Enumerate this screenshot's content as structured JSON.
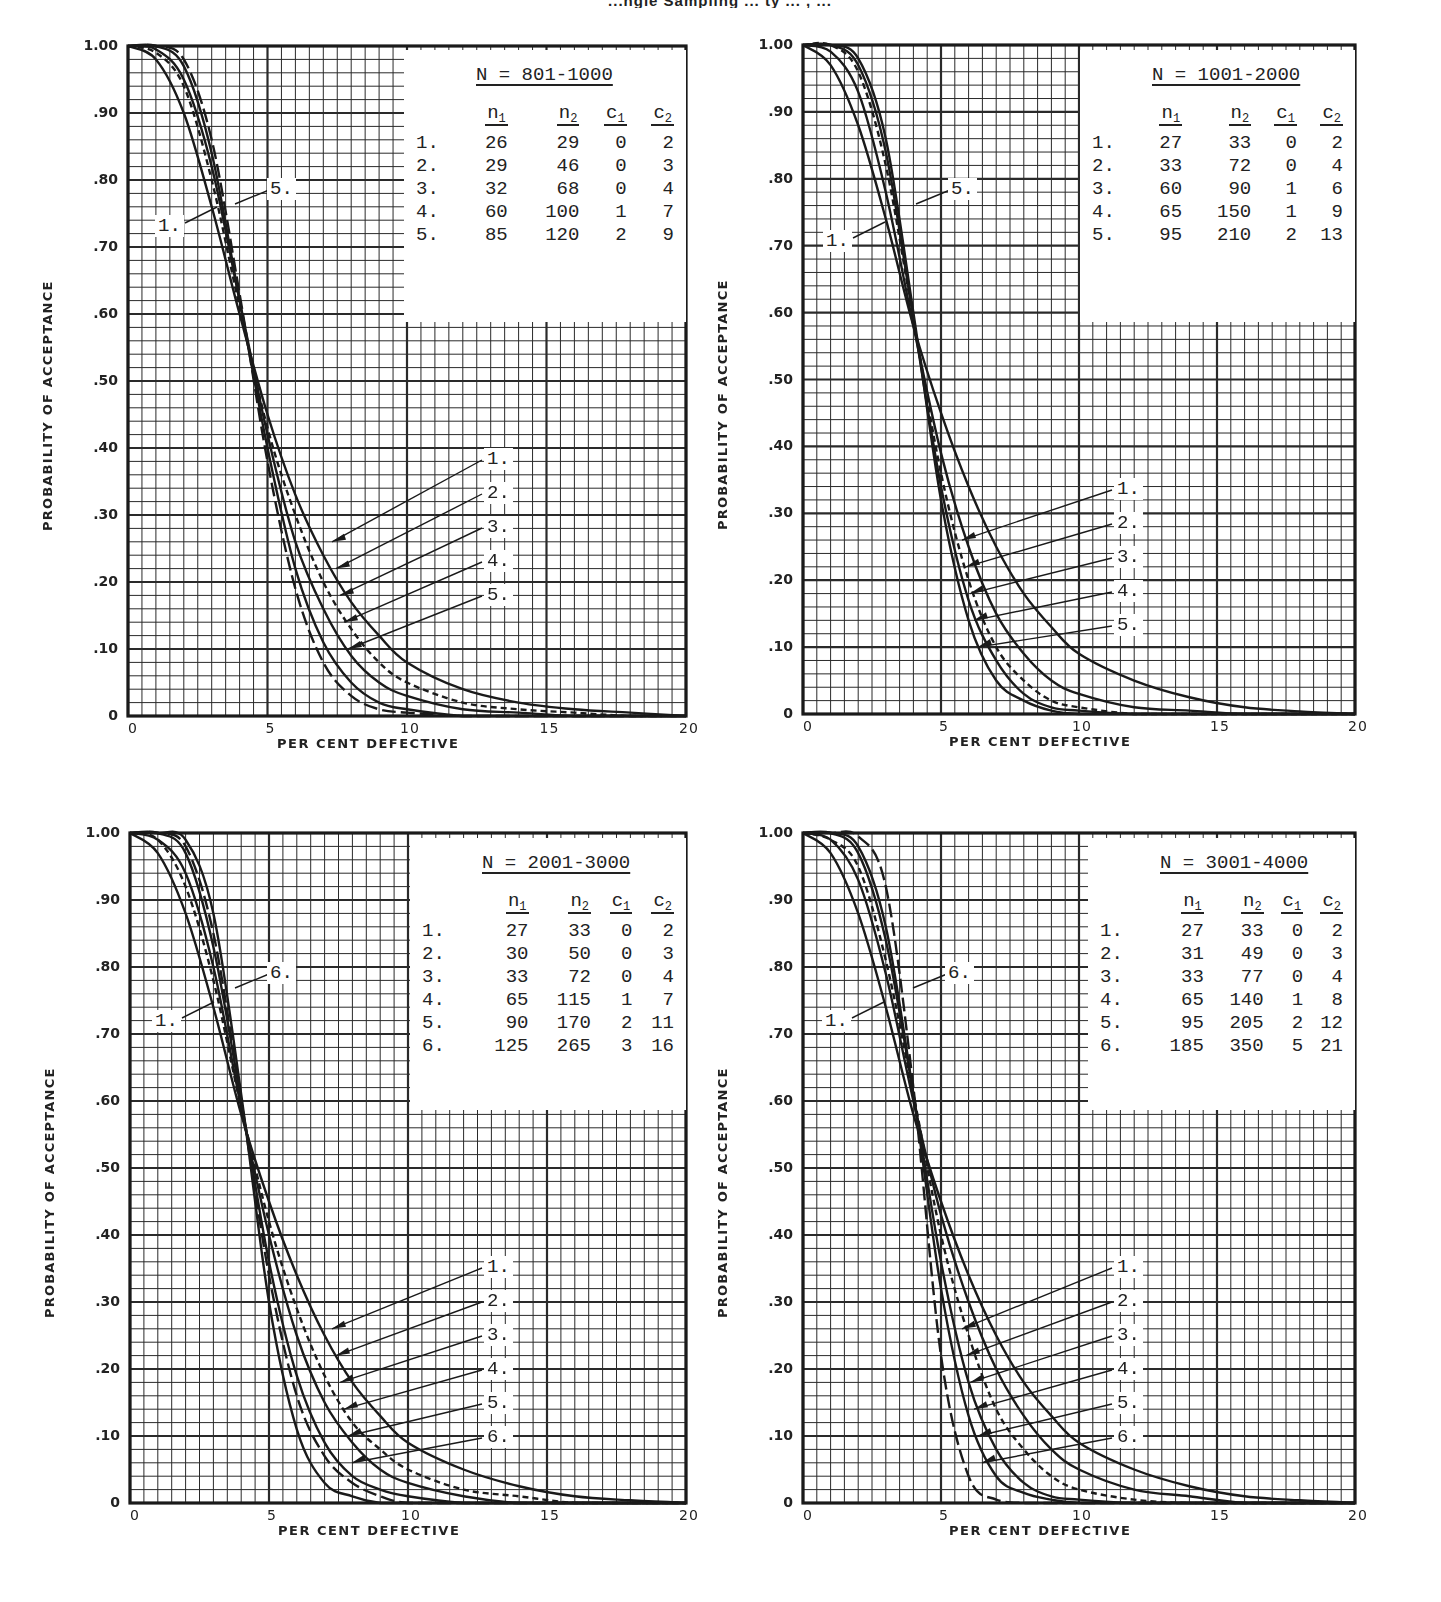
{
  "page": {
    "title_fragment": "...ngle Sampling ... ty ... , ..."
  },
  "axes": {
    "ylabel": "PROBABILITY OF ACCEPTANCE",
    "xlabel": "PER CENT DEFECTIVE",
    "yticks": [
      "1.00",
      ".90",
      ".80",
      ".70",
      ".60",
      ".50",
      ".40",
      ".30",
      ".20",
      ".10",
      "0"
    ],
    "xticks": [
      "0",
      "5",
      "10",
      "15",
      "20"
    ]
  },
  "legend_headers": {
    "n1": "n",
    "n1_sub": "1",
    "n2": "n",
    "n2_sub": "2",
    "c1": "c",
    "c1_sub": "1",
    "c2": "c",
    "c2_sub": "2"
  },
  "chart_data": [
    {
      "type": "line",
      "title": "N = 801-1000",
      "xlabel": "PER CENT DEFECTIVE",
      "ylabel": "PROBABILITY OF ACCEPTANCE",
      "xlim": [
        0,
        20
      ],
      "ylim": [
        0,
        1.0
      ],
      "grid": true,
      "legend_position": "upper right",
      "plans": [
        {
          "idx": "1.",
          "n1": 26,
          "n2": 29,
          "c1": 0,
          "c2": 2
        },
        {
          "idx": "2.",
          "n1": 29,
          "n2": 46,
          "c1": 0,
          "c2": 3
        },
        {
          "idx": "3.",
          "n1": 32,
          "n2": 68,
          "c1": 0,
          "c2": 4
        },
        {
          "idx": "4.",
          "n1": 60,
          "n2": 100,
          "c1": 1,
          "c2": 7
        },
        {
          "idx": "5.",
          "n1": 85,
          "n2": 120,
          "c1": 2,
          "c2": 9
        }
      ],
      "annotations": [
        "1.",
        "5.",
        "1.",
        "2.",
        "3.",
        "4.",
        "5."
      ],
      "x": [
        0,
        1,
        2,
        3,
        4,
        5,
        6,
        7,
        8,
        9,
        10,
        12,
        14,
        16,
        18,
        20
      ],
      "series": [
        {
          "name": "1.",
          "style": "solid",
          "values": [
            1.0,
            0.98,
            0.9,
            0.76,
            0.6,
            0.45,
            0.33,
            0.24,
            0.17,
            0.12,
            0.08,
            0.04,
            0.02,
            0.01,
            0.005,
            0.0
          ]
        },
        {
          "name": "2.",
          "style": "dashed",
          "values": [
            1.0,
            0.99,
            0.94,
            0.8,
            0.61,
            0.43,
            0.3,
            0.2,
            0.13,
            0.08,
            0.05,
            0.02,
            0.01,
            0.005,
            0.0,
            0.0
          ]
        },
        {
          "name": "3.",
          "style": "solid",
          "values": [
            1.0,
            0.995,
            0.95,
            0.82,
            0.62,
            0.42,
            0.26,
            0.16,
            0.09,
            0.05,
            0.03,
            0.01,
            0.005,
            0.0,
            0.0,
            0.0
          ]
        },
        {
          "name": "4.",
          "style": "solid",
          "values": [
            1.0,
            1.0,
            0.97,
            0.84,
            0.62,
            0.4,
            0.22,
            0.11,
            0.05,
            0.02,
            0.01,
            0.0,
            0.0,
            0.0,
            0.0,
            0.0
          ]
        },
        {
          "name": "5.",
          "style": "long-dash",
          "values": [
            1.0,
            1.0,
            0.98,
            0.86,
            0.63,
            0.38,
            0.19,
            0.08,
            0.03,
            0.01,
            0.005,
            0.0,
            0.0,
            0.0,
            0.0,
            0.0
          ]
        }
      ]
    },
    {
      "type": "line",
      "title": "N = 1001-2000",
      "xlabel": "PER CENT DEFECTIVE",
      "ylabel": "PROBABILITY OF ACCEPTANCE",
      "xlim": [
        0,
        20
      ],
      "ylim": [
        0,
        1.0
      ],
      "grid": true,
      "legend_position": "upper right",
      "plans": [
        {
          "idx": "1.",
          "n1": 27,
          "n2": 33,
          "c1": 0,
          "c2": 2
        },
        {
          "idx": "2.",
          "n1": 33,
          "n2": 72,
          "c1": 0,
          "c2": 4
        },
        {
          "idx": "3.",
          "n1": 60,
          "n2": 90,
          "c1": 1,
          "c2": 6
        },
        {
          "idx": "4.",
          "n1": 65,
          "n2": 150,
          "c1": 1,
          "c2": 9
        },
        {
          "idx": "5.",
          "n1": 95,
          "n2": 210,
          "c1": 2,
          "c2": 13
        }
      ],
      "annotations": [
        "1.",
        "5.",
        "1.",
        "2.",
        "3.",
        "4.",
        "5."
      ],
      "x": [
        0,
        1,
        2,
        3,
        4,
        5,
        6,
        7,
        8,
        9,
        10,
        12,
        14,
        16,
        18,
        20
      ],
      "series": [
        {
          "name": "1.",
          "style": "solid",
          "values": [
            1.0,
            0.97,
            0.88,
            0.74,
            0.58,
            0.45,
            0.34,
            0.25,
            0.18,
            0.13,
            0.09,
            0.05,
            0.025,
            0.01,
            0.004,
            0.0
          ]
        },
        {
          "name": "2.",
          "style": "solid",
          "values": [
            1.0,
            0.99,
            0.93,
            0.78,
            0.58,
            0.39,
            0.25,
            0.15,
            0.09,
            0.05,
            0.03,
            0.01,
            0.005,
            0.0,
            0.0,
            0.0
          ]
        },
        {
          "name": "3.",
          "style": "dashed",
          "values": [
            1.0,
            1.0,
            0.96,
            0.82,
            0.59,
            0.36,
            0.2,
            0.1,
            0.05,
            0.02,
            0.01,
            0.0,
            0.0,
            0.0,
            0.0,
            0.0
          ]
        },
        {
          "name": "4.",
          "style": "solid",
          "values": [
            1.0,
            1.0,
            0.97,
            0.84,
            0.59,
            0.34,
            0.17,
            0.08,
            0.03,
            0.01,
            0.005,
            0.0,
            0.0,
            0.0,
            0.0,
            0.0
          ]
        },
        {
          "name": "5.",
          "style": "solid",
          "values": [
            1.0,
            1.0,
            0.98,
            0.86,
            0.6,
            0.32,
            0.14,
            0.05,
            0.02,
            0.005,
            0.0,
            0.0,
            0.0,
            0.0,
            0.0,
            0.0
          ]
        }
      ]
    },
    {
      "type": "line",
      "title": "N = 2001-3000",
      "xlabel": "PER CENT DEFECTIVE",
      "ylabel": "PROBABILITY OF ACCEPTANCE",
      "xlim": [
        0,
        20
      ],
      "ylim": [
        0,
        1.0
      ],
      "grid": true,
      "legend_position": "upper right",
      "plans": [
        {
          "idx": "1.",
          "n1": 27,
          "n2": 33,
          "c1": 0,
          "c2": 2
        },
        {
          "idx": "2.",
          "n1": 30,
          "n2": 50,
          "c1": 0,
          "c2": 3
        },
        {
          "idx": "3.",
          "n1": 33,
          "n2": 72,
          "c1": 0,
          "c2": 4
        },
        {
          "idx": "4.",
          "n1": 65,
          "n2": 115,
          "c1": 1,
          "c2": 7
        },
        {
          "idx": "5.",
          "n1": 90,
          "n2": 170,
          "c1": 2,
          "c2": 11
        },
        {
          "idx": "6.",
          "n1": 125,
          "n2": 265,
          "c1": 3,
          "c2": 16
        }
      ],
      "annotations": [
        "1.",
        "6.",
        "1.",
        "2.",
        "3.",
        "4.",
        "5.",
        "6."
      ],
      "x": [
        0,
        1,
        2,
        3,
        4,
        5,
        6,
        7,
        8,
        9,
        10,
        12,
        14,
        16,
        18,
        20
      ],
      "series": [
        {
          "name": "1.",
          "style": "solid",
          "values": [
            1.0,
            0.97,
            0.88,
            0.74,
            0.58,
            0.45,
            0.34,
            0.25,
            0.18,
            0.13,
            0.09,
            0.05,
            0.025,
            0.01,
            0.004,
            0.0
          ]
        },
        {
          "name": "2.",
          "style": "dashed",
          "values": [
            1.0,
            0.99,
            0.92,
            0.78,
            0.59,
            0.42,
            0.29,
            0.19,
            0.12,
            0.08,
            0.05,
            0.02,
            0.01,
            0.0,
            0.0,
            0.0
          ]
        },
        {
          "name": "3.",
          "style": "solid",
          "values": [
            1.0,
            0.99,
            0.94,
            0.8,
            0.59,
            0.4,
            0.25,
            0.15,
            0.09,
            0.05,
            0.03,
            0.01,
            0.0,
            0.0,
            0.0,
            0.0
          ]
        },
        {
          "name": "4.",
          "style": "solid",
          "values": [
            1.0,
            1.0,
            0.97,
            0.83,
            0.6,
            0.36,
            0.19,
            0.09,
            0.04,
            0.02,
            0.01,
            0.0,
            0.0,
            0.0,
            0.0,
            0.0
          ]
        },
        {
          "name": "5.",
          "style": "long-dash",
          "values": [
            1.0,
            1.0,
            0.98,
            0.85,
            0.6,
            0.34,
            0.16,
            0.07,
            0.03,
            0.01,
            0.0,
            0.0,
            0.0,
            0.0,
            0.0,
            0.0
          ]
        },
        {
          "name": "6.",
          "style": "solid",
          "values": [
            1.0,
            1.0,
            0.99,
            0.88,
            0.61,
            0.3,
            0.11,
            0.03,
            0.01,
            0.0,
            0.0,
            0.0,
            0.0,
            0.0,
            0.0,
            0.0
          ]
        }
      ]
    },
    {
      "type": "line",
      "title": "N = 3001-4000",
      "xlabel": "PER CENT DEFECTIVE",
      "ylabel": "PROBABILITY OF ACCEPTANCE",
      "xlim": [
        0,
        20
      ],
      "ylim": [
        0,
        1.0
      ],
      "grid": true,
      "legend_position": "upper right",
      "plans": [
        {
          "idx": "1.",
          "n1": 27,
          "n2": 33,
          "c1": 0,
          "c2": 2
        },
        {
          "idx": "2.",
          "n1": 31,
          "n2": 49,
          "c1": 0,
          "c2": 3
        },
        {
          "idx": "3.",
          "n1": 33,
          "n2": 77,
          "c1": 0,
          "c2": 4
        },
        {
          "idx": "4.",
          "n1": 65,
          "n2": 140,
          "c1": 1,
          "c2": 8
        },
        {
          "idx": "5.",
          "n1": 95,
          "n2": 205,
          "c1": 2,
          "c2": 12
        },
        {
          "idx": "6.",
          "n1": 185,
          "n2": 350,
          "c1": 5,
          "c2": 21
        }
      ],
      "annotations": [
        "1.",
        "6.",
        "1.",
        "2.",
        "3.",
        "4.",
        "5.",
        "6."
      ],
      "x": [
        0,
        1,
        2,
        3,
        4,
        5,
        6,
        7,
        8,
        9,
        10,
        12,
        14,
        16,
        18,
        20
      ],
      "series": [
        {
          "name": "1.",
          "style": "solid",
          "values": [
            1.0,
            0.97,
            0.88,
            0.74,
            0.58,
            0.45,
            0.34,
            0.25,
            0.18,
            0.13,
            0.09,
            0.05,
            0.025,
            0.01,
            0.004,
            0.0
          ]
        },
        {
          "name": "2.",
          "style": "solid",
          "values": [
            1.0,
            0.99,
            0.93,
            0.79,
            0.6,
            0.43,
            0.3,
            0.2,
            0.13,
            0.08,
            0.05,
            0.02,
            0.01,
            0.0,
            0.0,
            0.0
          ]
        },
        {
          "name": "3.",
          "style": "dashed",
          "values": [
            1.0,
            0.99,
            0.95,
            0.81,
            0.61,
            0.4,
            0.25,
            0.14,
            0.08,
            0.04,
            0.02,
            0.005,
            0.0,
            0.0,
            0.0,
            0.0
          ]
        },
        {
          "name": "4.",
          "style": "solid",
          "values": [
            1.0,
            1.0,
            0.97,
            0.84,
            0.61,
            0.36,
            0.18,
            0.08,
            0.03,
            0.01,
            0.005,
            0.0,
            0.0,
            0.0,
            0.0,
            0.0
          ]
        },
        {
          "name": "5.",
          "style": "solid",
          "values": [
            1.0,
            1.0,
            0.98,
            0.86,
            0.61,
            0.32,
            0.13,
            0.04,
            0.015,
            0.005,
            0.0,
            0.0,
            0.0,
            0.0,
            0.0,
            0.0
          ]
        },
        {
          "name": "6.",
          "style": "long-dash",
          "values": [
            1.0,
            1.0,
            0.995,
            0.92,
            0.62,
            0.22,
            0.04,
            0.005,
            0.0,
            0.0,
            0.0,
            0.0,
            0.0,
            0.0,
            0.0,
            0.0
          ]
        }
      ]
    }
  ]
}
